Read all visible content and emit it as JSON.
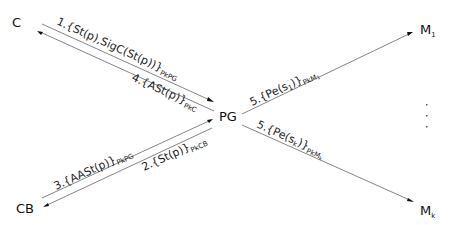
{
  "nodes": {
    "c": {
      "label": "C"
    },
    "pg": {
      "label": "PG"
    },
    "cb": {
      "label": "CB"
    },
    "m1": {
      "label": "M",
      "sub": "1"
    },
    "mk": {
      "label": "M",
      "sub": "k"
    }
  },
  "messages": [
    {
      "id": "msg1",
      "main": "1.{St(p),SigC(St(p))}",
      "sub": "PkPG",
      "from": "C",
      "to": "PG"
    },
    {
      "id": "msg2",
      "main": "2.{St(p)}",
      "sub": "PkCB",
      "from": "PG",
      "to": "CB"
    },
    {
      "id": "msg3",
      "main": "3.{AASt(p)}",
      "sub": "PkPG",
      "from": "CB",
      "to": "PG"
    },
    {
      "id": "msg4",
      "main": "4.{ASt(p)}",
      "sub": "PkC",
      "from": "PG",
      "to": "C"
    },
    {
      "id": "msg5a",
      "main": "5.{Pe(s",
      "main_sub": "1",
      "main_end": ")}",
      "sub": "PkM",
      "sub_sub": "1",
      "from": "PG",
      "to": "M1"
    },
    {
      "id": "msg5b",
      "main": "5.{Pe(s",
      "main_sub": "k",
      "main_end": ")}",
      "sub": "PkM",
      "sub_sub": "k",
      "from": "PG",
      "to": "Mk"
    }
  ],
  "ellipsis": "vertical-dots",
  "colors": {
    "edge": "#777777",
    "text": "#111111",
    "background": "#ffffff"
  }
}
